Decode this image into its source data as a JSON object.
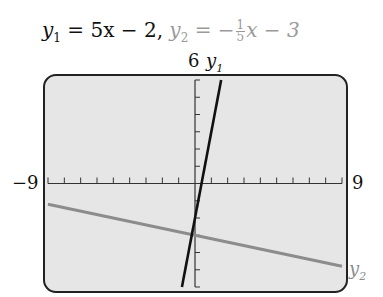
{
  "title": {
    "y1_label": "y",
    "y1_sub": "1",
    "y1_rhs": "= 5x − 2,",
    "y2_label": "y",
    "y2_sub": "2",
    "y2_eq": "= −",
    "y2_frac_num": "1",
    "y2_frac_den": "5",
    "y2_tail": "x − 3"
  },
  "axis_labels": {
    "ymax": "6",
    "xmin": "−9",
    "xmax": "9",
    "y1_curve_label": "y",
    "y1_curve_sub": "1",
    "y2_curve_label": "y",
    "y2_curve_sub": "2"
  },
  "chart_data": {
    "type": "line",
    "xlabel": "",
    "ylabel": "",
    "xlim": [
      -9,
      9
    ],
    "ylim": [
      -6,
      6
    ],
    "x_tick_step": 1,
    "y_tick_step": 1,
    "grid": false,
    "series": [
      {
        "name": "y1",
        "equation": "5x - 2",
        "color": "#111111",
        "x": [
          -0.8,
          1.6
        ],
        "y": [
          -6,
          6
        ]
      },
      {
        "name": "y2",
        "equation": "-(1/5)x - 3",
        "color": "#8c8c8c",
        "x": [
          -9,
          9
        ],
        "y": [
          -1.2,
          -4.8
        ]
      }
    ],
    "annotations": [
      "6 (ymax)",
      "-9 (xmin)",
      "9 (xmax)",
      "y1",
      "y2"
    ]
  }
}
